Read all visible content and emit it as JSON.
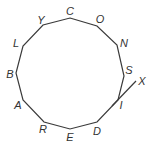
{
  "diagram": {
    "type": "polygon",
    "sides": 12,
    "stroke_color": "#3a3a3a",
    "label_color": "#333333",
    "vertices": [
      {
        "label": "C",
        "x": 70,
        "y": 18,
        "lx": 70,
        "ly": 15
      },
      {
        "label": "O",
        "x": 97,
        "y": 26,
        "lx": 100,
        "ly": 23
      },
      {
        "label": "N",
        "x": 117,
        "y": 45,
        "lx": 124,
        "ly": 47
      },
      {
        "label": "S",
        "x": 124,
        "y": 76,
        "lx": 129,
        "ly": 74
      },
      {
        "label": "I",
        "x": 118,
        "y": 100,
        "lx": 121,
        "ly": 109
      },
      {
        "label": "D",
        "x": 97,
        "y": 122,
        "lx": 97,
        "ly": 135
      },
      {
        "label": "E",
        "x": 70,
        "y": 129,
        "lx": 70,
        "ly": 141
      },
      {
        "label": "R",
        "x": 44,
        "y": 122,
        "lx": 43,
        "ly": 133
      },
      {
        "label": "A",
        "x": 23,
        "y": 100,
        "lx": 18,
        "ly": 109
      },
      {
        "label": "B",
        "x": 16,
        "y": 73,
        "lx": 10,
        "ly": 78
      },
      {
        "label": "L",
        "x": 23,
        "y": 46,
        "lx": 16,
        "ly": 47
      },
      {
        "label": "Y",
        "x": 43,
        "y": 25,
        "lx": 41,
        "ly": 24
      }
    ],
    "ray": {
      "label": "X",
      "x1": 112,
      "y1": 106,
      "x2": 136,
      "y2": 81,
      "lx": 142,
      "ly": 85
    }
  }
}
